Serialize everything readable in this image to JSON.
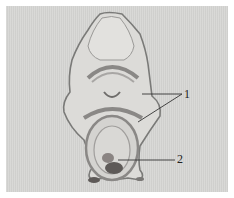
{
  "figure": {
    "labels": [
      {
        "id": "label-1",
        "text": "1",
        "x": 184,
        "y": 89
      },
      {
        "id": "label-2",
        "text": "2",
        "x": 177,
        "y": 153
      }
    ],
    "colors": {
      "background": "#d6d6d4",
      "outline": "#7a7a78",
      "dark_tissue": "#5e5a58",
      "leader_line": "#333333"
    }
  }
}
